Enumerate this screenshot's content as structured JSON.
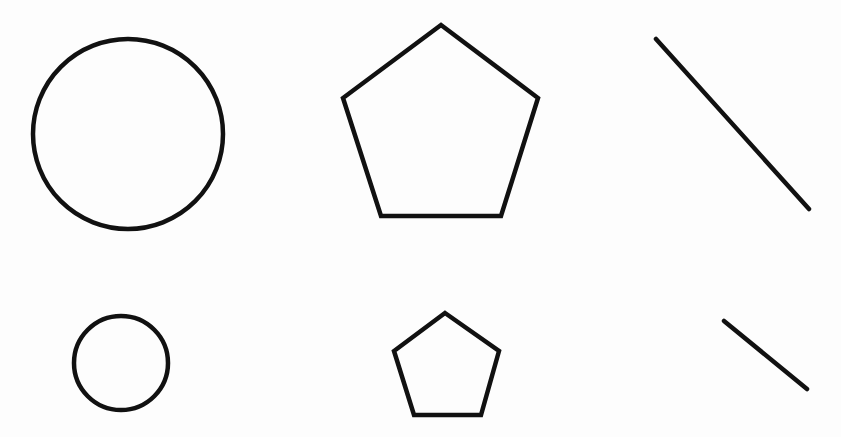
{
  "diagram": {
    "background": "#fdfdfd",
    "stroke_color": "#111111",
    "rows": [
      {
        "size": "large",
        "circle": {
          "cx": 128,
          "cy": 134,
          "r": 95
        },
        "pentagon": {
          "points": "441,25 538,98 501,216 381,216 343,98"
        },
        "line": {
          "x1": 656,
          "y1": 39,
          "x2": 809,
          "y2": 209
        }
      },
      {
        "size": "small",
        "circle": {
          "cx": 121,
          "cy": 363,
          "r": 47
        },
        "pentagon": {
          "points": "445,313 499,351 481,415 414,415 394,351"
        },
        "line": {
          "x1": 724,
          "y1": 321,
          "x2": 807,
          "y2": 389
        }
      }
    ]
  }
}
